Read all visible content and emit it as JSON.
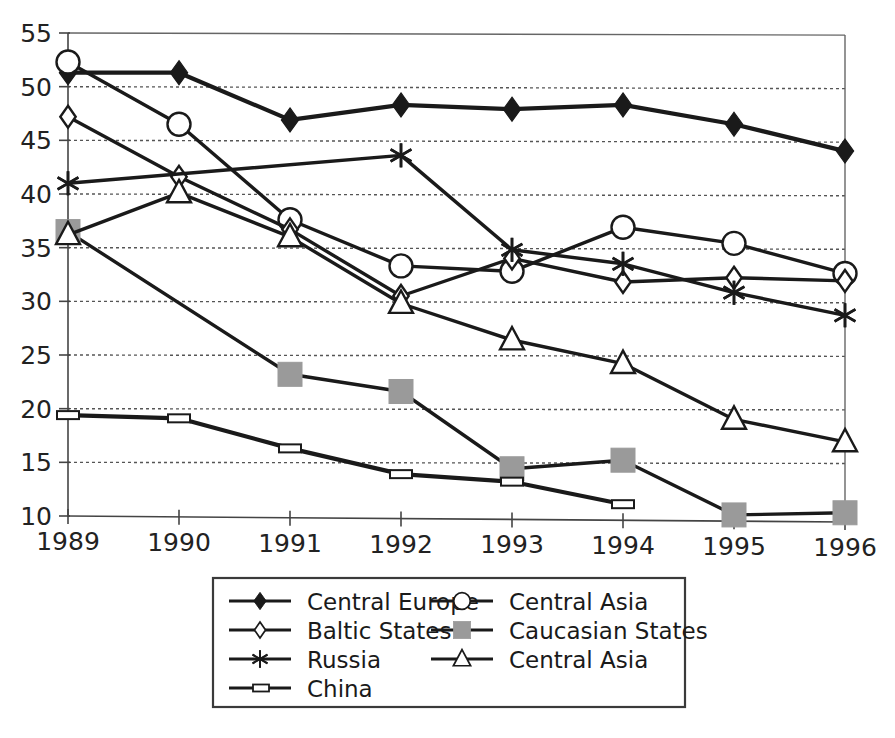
{
  "chart_data": {
    "type": "line",
    "title": "",
    "subtitle": "",
    "xlabel": "",
    "ylabel": "",
    "categories": [
      "1989",
      "1990",
      "1991",
      "1992",
      "1993",
      "1994",
      "1995",
      "1996"
    ],
    "x": [
      1989,
      1990,
      1991,
      1992,
      1993,
      1994,
      1995,
      1996
    ],
    "xlim": [
      1989,
      1996
    ],
    "ylim": [
      10,
      55
    ],
    "y_ticks": [
      10,
      15,
      20,
      25,
      30,
      35,
      40,
      45,
      50,
      55
    ],
    "y_tick_labels": [
      "10",
      "15",
      "20",
      "25",
      "30",
      "35",
      "40",
      "45",
      "50",
      "55"
    ],
    "grid": "horizontal-dotted",
    "legend_position": "bottom-center",
    "series": [
      {
        "name": "Central Europe",
        "marker": "filled-diamond",
        "values": [
          51.3,
          51.3,
          46.9,
          48.3,
          47.9,
          48.3,
          46.5,
          44.0
        ]
      },
      {
        "name": "Central Asia",
        "marker": "open-circle",
        "values": [
          52.3,
          46.5,
          37.6,
          33.3,
          32.8,
          36.9,
          35.4,
          32.6
        ]
      },
      {
        "name": "Baltic States",
        "marker": "open-diamond",
        "values": [
          47.2,
          41.6,
          36.7,
          30.5,
          34.0,
          31.8,
          32.2,
          31.9
        ]
      },
      {
        "name": "Caucasian States",
        "marker": "gray-square",
        "values": [
          36.5,
          null,
          23.2,
          21.6,
          14.4,
          15.2,
          10.1,
          10.3
        ]
      },
      {
        "name": "Russia",
        "marker": "asterisk",
        "values": [
          41.0,
          null,
          null,
          43.6,
          34.8,
          33.5,
          30.8,
          28.7
        ]
      },
      {
        "name": "Central Asia",
        "marker": "open-triangle",
        "values": [
          36.2,
          40.1,
          36.0,
          29.8,
          26.4,
          24.2,
          19.0,
          16.9
        ]
      },
      {
        "name": "China",
        "marker": "none",
        "values": [
          19.4,
          19.1,
          16.3,
          13.9,
          13.2,
          11.1,
          null,
          null
        ]
      }
    ],
    "legend_entries": [
      {
        "label": "Central Europe",
        "marker": "filled-diamond",
        "column": 0,
        "row": 0
      },
      {
        "label": "Baltic States",
        "marker": "open-diamond",
        "column": 0,
        "row": 1
      },
      {
        "label": "Russia",
        "marker": "asterisk",
        "column": 0,
        "row": 2
      },
      {
        "label": "China",
        "marker": "none",
        "column": 0,
        "row": 3
      },
      {
        "label": "Central Asia",
        "marker": "open-circle",
        "column": 1,
        "row": 0
      },
      {
        "label": "Caucasian States",
        "marker": "gray-square",
        "column": 1,
        "row": 1
      },
      {
        "label": "Central Asia",
        "marker": "open-triangle",
        "column": 1,
        "row": 2
      }
    ],
    "colors": {
      "line": "#1a1a1a",
      "gray_marker": "#9a9a9a",
      "grid": "#555555",
      "axis": "#444444",
      "background": "#ffffff"
    }
  }
}
